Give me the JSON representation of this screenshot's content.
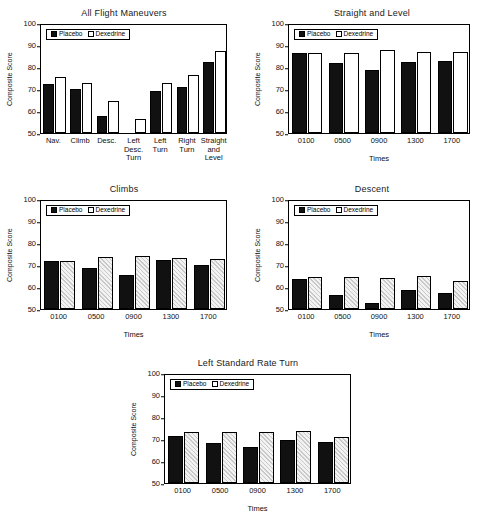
{
  "figure": {
    "ylabel": "Composite Score",
    "xlabel": "Times",
    "legend": {
      "placebo": "Placebo",
      "dexedrine": "Dexedrine"
    },
    "yticks": [
      "100",
      "90",
      "80",
      "70",
      "60",
      "50"
    ]
  },
  "chart_data": [
    {
      "type": "bar",
      "title": "All Flight Maneuvers",
      "xlabel": "",
      "ylabel": "Composite Score",
      "ylim": [
        50,
        100
      ],
      "yticks": [
        50,
        60,
        70,
        80,
        90,
        100
      ],
      "grid": false,
      "legend_position": "top-left inside",
      "categories": [
        "Nav.",
        "Climb",
        "Desc.",
        "Left Desc. Turn",
        "Left Turn",
        "Right Turn",
        "Straight and Level"
      ],
      "series": [
        {
          "name": "Placebo",
          "values": [
            72.3,
            69.8,
            57.9,
            null,
            68.9,
            70.9,
            82.5
          ]
        },
        {
          "name": "Dexedrine",
          "values": [
            75.4,
            72.9,
            64.4,
            56.3,
            72.8,
            76.2,
            87.1
          ]
        }
      ]
    },
    {
      "type": "bar",
      "title": "Straight and Level",
      "xlabel": "Times",
      "ylabel": "Composite Score",
      "ylim": [
        50,
        100
      ],
      "yticks": [
        50,
        60,
        70,
        80,
        90,
        100
      ],
      "grid": false,
      "legend_position": "top-left inside",
      "categories": [
        "0100",
        "0500",
        "0900",
        "1300",
        "1700"
      ],
      "series": [
        {
          "name": "Placebo",
          "values": [
            86.2,
            82.0,
            78.8,
            82.4,
            82.8
          ]
        },
        {
          "name": "Dexedrine",
          "values": [
            86.2,
            86.4,
            87.7,
            86.9,
            86.6
          ]
        }
      ]
    },
    {
      "type": "bar",
      "title": "Climbs",
      "xlabel": "Times",
      "ylabel": "Composite Score",
      "ylim": [
        50,
        100
      ],
      "yticks": [
        50,
        60,
        70,
        80,
        90,
        100
      ],
      "grid": false,
      "legend_position": "top-left inside",
      "categories": [
        "0100",
        "0500",
        "0900",
        "1300",
        "1700"
      ],
      "series": [
        {
          "name": "Placebo",
          "values": [
            72.0,
            68.5,
            65.4,
            72.4,
            70.0
          ]
        },
        {
          "name": "Dexedrine",
          "values": [
            72.0,
            73.8,
            73.9,
            73.3,
            72.8
          ]
        }
      ]
    },
    {
      "type": "bar",
      "title": "Descent",
      "xlabel": "Times",
      "ylabel": "Composite Score",
      "ylim": [
        50,
        100
      ],
      "yticks": [
        50,
        60,
        70,
        80,
        90,
        100
      ],
      "grid": false,
      "legend_position": "top-left inside",
      "categories": [
        "0100",
        "0500",
        "0900",
        "1300",
        "1700"
      ],
      "series": [
        {
          "name": "Placebo",
          "values": [
            63.5,
            56.5,
            52.9,
            58.8,
            57.3
          ]
        },
        {
          "name": "Dexedrine",
          "values": [
            64.4,
            64.4,
            64.2,
            65.0,
            62.9
          ]
        }
      ]
    },
    {
      "type": "bar",
      "title": "Left Standard Rate Turn",
      "xlabel": "Times",
      "ylabel": "Composite Score",
      "ylim": [
        50,
        100
      ],
      "yticks": [
        50,
        60,
        70,
        80,
        90,
        100
      ],
      "grid": false,
      "legend_position": "top-left inside",
      "categories": [
        "0100",
        "0500",
        "0900",
        "1300",
        "1700"
      ],
      "series": [
        {
          "name": "Placebo",
          "values": [
            71.5,
            68.0,
            66.2,
            69.4,
            68.8
          ]
        },
        {
          "name": "Dexedrine",
          "values": [
            73.0,
            73.2,
            73.0,
            73.8,
            70.9
          ]
        }
      ]
    }
  ]
}
